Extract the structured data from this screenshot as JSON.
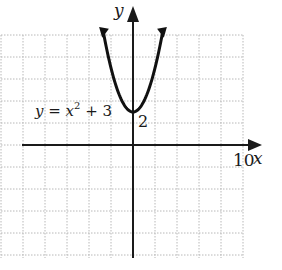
{
  "chart_data": {
    "type": "line",
    "title": "",
    "xlabel": "x",
    "ylabel": "y",
    "xlim": [
      -12,
      10
    ],
    "ylim": [
      -10,
      10
    ],
    "grid": true,
    "grid_spacing": 2,
    "tick_labels": {
      "x": [
        "10"
      ],
      "y": [
        "2"
      ]
    },
    "annotations": [
      "y = x^2 + 3",
      "2"
    ],
    "series": [
      {
        "name": "y = x^2 + 3",
        "function": "x^2 + 3",
        "vertex": [
          0,
          3
        ],
        "x": [
          -2.7,
          -2,
          -1.5,
          -1,
          -0.5,
          0,
          0.5,
          1,
          1.5,
          2,
          2.7
        ],
        "y": [
          10.29,
          7,
          5.25,
          4,
          3.25,
          3,
          3.25,
          4,
          5.25,
          7,
          10.29
        ]
      }
    ]
  },
  "labels": {
    "y_axis": "y",
    "x_axis": "x",
    "x_tick": "10",
    "y_tick": "2",
    "equation_prefix": "y = x",
    "equation_exp": "2",
    "equation_suffix": " + 3"
  },
  "colors": {
    "axis": "#1a1a1a",
    "curve": "#111111",
    "grid": "#b8b8b8",
    "background": "#ffffff"
  }
}
